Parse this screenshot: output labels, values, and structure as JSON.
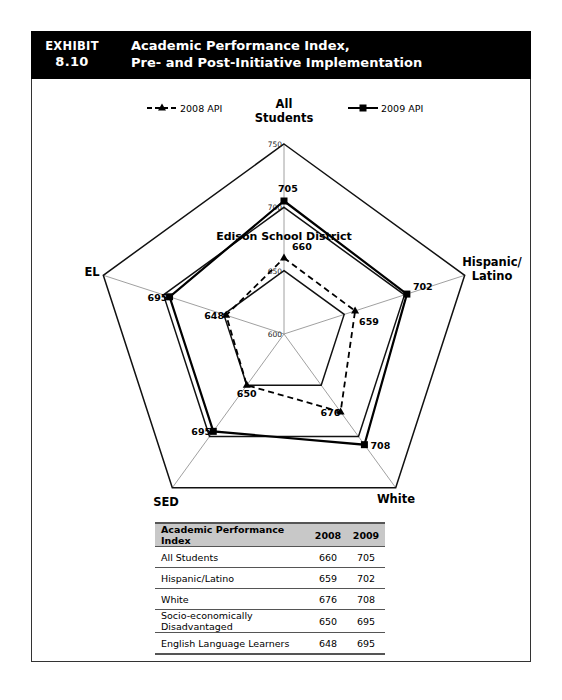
{
  "header": {
    "exhibit_label": "EXHIBIT",
    "exhibit_number": "8.10",
    "title_line1": "Academic Performance Index,",
    "title_line2": "Pre- and Post-Initiative Implementation"
  },
  "chart_data": {
    "type": "radar",
    "title": "Edison School District",
    "axes": [
      "All Students",
      "Hispanic/ Latino",
      "White",
      "SED",
      "EL"
    ],
    "axis_label_lines": [
      [
        "All",
        "Students"
      ],
      [
        "Hispanic/",
        "Latino"
      ],
      [
        "White"
      ],
      [
        "SED"
      ],
      [
        "EL"
      ]
    ],
    "rings": [
      600,
      650,
      700,
      750
    ],
    "ring_labels_on_axis": "All Students",
    "range": [
      600,
      750
    ],
    "series": [
      {
        "name": "2008 API",
        "marker": "triangle",
        "line": "dashed",
        "values": [
          660,
          659,
          676,
          650,
          648
        ]
      },
      {
        "name": "2009 API",
        "marker": "square",
        "line": "solid",
        "values": [
          705,
          702,
          708,
          695,
          695
        ]
      }
    ],
    "legend_position": "top"
  },
  "table": {
    "headers": [
      "Academic Performance Index",
      "2008",
      "2009"
    ],
    "rows": [
      [
        "All Students",
        "660",
        "705"
      ],
      [
        "Hispanic/Latino",
        "659",
        "702"
      ],
      [
        "White",
        "676",
        "708"
      ],
      [
        "Socio-economically Disadvantaged",
        "650",
        "695"
      ],
      [
        "English Language Learners",
        "648",
        "695"
      ]
    ]
  }
}
